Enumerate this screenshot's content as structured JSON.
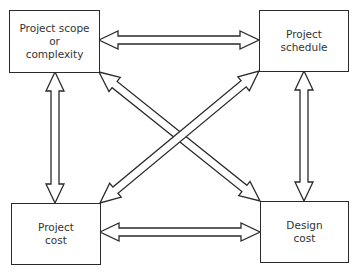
{
  "diagram": {
    "type": "relationship-diagram",
    "nodes": [
      {
        "id": "scope",
        "label": "Project scope\nor\ncomplexity",
        "position": "top-left"
      },
      {
        "id": "schedule",
        "label": "Project\nschedule",
        "position": "top-right"
      },
      {
        "id": "pcost",
        "label": "Project\ncost",
        "position": "bottom-left"
      },
      {
        "id": "dcost",
        "label": "Design\ncost",
        "position": "bottom-right"
      }
    ],
    "edges": [
      {
        "from": "scope",
        "to": "schedule",
        "style": "double-headed hollow arrow"
      },
      {
        "from": "scope",
        "to": "pcost",
        "style": "double-headed hollow arrow"
      },
      {
        "from": "schedule",
        "to": "dcost",
        "style": "double-headed hollow arrow"
      },
      {
        "from": "pcost",
        "to": "dcost",
        "style": "double-headed hollow arrow"
      },
      {
        "from": "scope",
        "to": "dcost",
        "style": "double-headed hollow arrow"
      },
      {
        "from": "schedule",
        "to": "pcost",
        "style": "double-headed hollow arrow"
      }
    ],
    "colors": {
      "stroke": "#2a2a2a",
      "fill": "#ffffff",
      "text": "#333333"
    }
  }
}
